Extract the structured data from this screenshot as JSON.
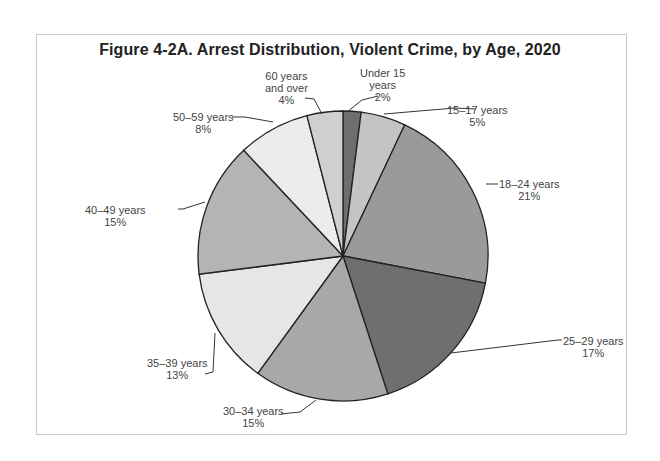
{
  "title": "Figure 4-2A. Arrest Distribution, Violent Crime, by Age, 2020",
  "chart_data": {
    "type": "pie",
    "title": "Figure 4-2A. Arrest Distribution, Violent Crime, by Age, 2020",
    "start_angle": "12 o'clock, clockwise",
    "categories": [
      "Under 15 years",
      "15–17 years",
      "18–24 years",
      "25–29 years",
      "30–34 years",
      "35–39 years",
      "40–49 years",
      "50–59 years",
      "60 years and over"
    ],
    "values": [
      2,
      5,
      21,
      17,
      15,
      13,
      15,
      8,
      4
    ],
    "unit": "%",
    "colors": [
      "#6e6e6e",
      "#c4c4c4",
      "#9a9a9a",
      "#6f6f6f",
      "#a8a8a8",
      "#e6e6e6",
      "#b4b4b4",
      "#ececec",
      "#cfcfcf"
    ]
  },
  "labels": [
    {
      "name": "Under 15",
      "line2": "years",
      "pct": "2%"
    },
    {
      "name": "15–17 years",
      "pct": "5%"
    },
    {
      "name": "18–24 years",
      "pct": "21%"
    },
    {
      "name": "25–29 years",
      "pct": "17%"
    },
    {
      "name": "30–34 years",
      "pct": "15%"
    },
    {
      "name": "35–39 years",
      "pct": "13%"
    },
    {
      "name": "40–49 years",
      "pct": "15%"
    },
    {
      "name": "50–59 years",
      "pct": "8%"
    },
    {
      "name": "60 years",
      "line2": "and over",
      "pct": "4%"
    }
  ]
}
